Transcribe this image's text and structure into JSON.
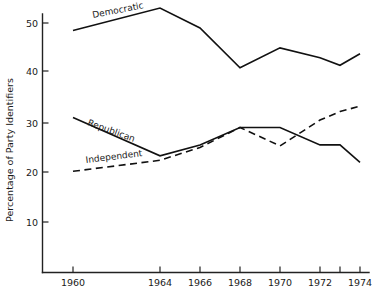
{
  "chart_data": {
    "type": "line",
    "title": "",
    "xlabel": "",
    "ylabel": "Percentage of Party Identifiers",
    "xlim": [
      1959,
      1975
    ],
    "ylim": [
      0,
      53.5
    ],
    "grid": false,
    "legend_position": "inline-labels",
    "x_tick_labels": [
      "1960",
      "1964",
      "1966",
      "1968",
      "1970",
      "1972",
      "1974"
    ],
    "x_tick_values": [
      1960,
      1964,
      1966,
      1968,
      1970,
      1972,
      1974
    ],
    "x_unlabeled_ticks": [
      1973
    ],
    "y_tick_labels": [
      "10",
      "20",
      "30",
      "40",
      "50"
    ],
    "y_tick_values": [
      10,
      20,
      30,
      40,
      50
    ],
    "series": [
      {
        "name": "Democratic",
        "label": "Democratic",
        "style": "solid",
        "color": "#111111",
        "x": [
          1960,
          1964,
          1966,
          1968,
          1970,
          1972,
          1973,
          1974
        ],
        "values": [
          48.5,
          53.0,
          49.0,
          41.0,
          45.0,
          43.0,
          41.5,
          43.8
        ]
      },
      {
        "name": "Republican",
        "label": "Republican",
        "style": "solid",
        "color": "#111111",
        "x": [
          1960,
          1964,
          1966,
          1968,
          1970,
          1972,
          1973,
          1974
        ],
        "values": [
          31.0,
          23.3,
          25.5,
          29.0,
          29.0,
          25.5,
          25.5,
          22.0
        ]
      },
      {
        "name": "Independent",
        "label": "Independent",
        "style": "dashed",
        "color": "#111111",
        "x": [
          1960,
          1964,
          1966,
          1968,
          1970,
          1972,
          1973,
          1974
        ],
        "values": [
          20.2,
          22.4,
          25.0,
          29.0,
          25.3,
          30.5,
          32.2,
          33.3
        ]
      }
    ]
  },
  "axis": {
    "y_title": "Percentage of Party Identifiers"
  },
  "series_labels": {
    "democratic": "Democratic",
    "republican": "Republican",
    "independent": "Independent"
  },
  "y_ticks": {
    "t10": "10",
    "t20": "20",
    "t30": "30",
    "t40": "40",
    "t50": "50"
  },
  "x_ticks": {
    "t1960": "1960",
    "t1964": "1964",
    "t1966": "1966",
    "t1968": "1968",
    "t1970": "1970",
    "t1972": "1972",
    "t1974": "1974"
  }
}
